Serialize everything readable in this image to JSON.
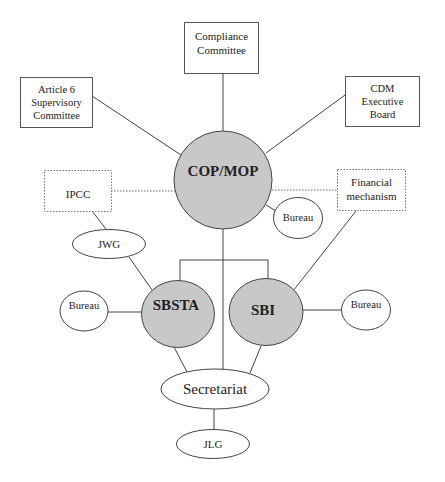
{
  "diagram": {
    "title": "",
    "nodes": {
      "compliance": {
        "line1": "Compliance",
        "line2": "Committee"
      },
      "article6": {
        "line1": "Article 6",
        "line2": "Supervisory",
        "line3": "Committee"
      },
      "cdm": {
        "line1": "CDM",
        "line2": "Executive",
        "line3": "Board"
      },
      "copmop": {
        "label": "COP/MOP"
      },
      "ipcc": {
        "label": "IPCC"
      },
      "financial": {
        "line1": "Financial",
        "line2": "mechanism"
      },
      "bureau_cop": {
        "label": "Bureau"
      },
      "jwg": {
        "label": "JWG"
      },
      "sbsta": {
        "label": "SBSTA"
      },
      "sbi": {
        "label": "SBI"
      },
      "bureau_sbsta": {
        "label": "Bureau"
      },
      "bureau_sbi": {
        "label": "Bureau"
      },
      "secretariat": {
        "label": "Secretariat"
      },
      "jlg": {
        "label": "JLG"
      }
    },
    "edges": [
      {
        "from": "compliance",
        "to": "copmop",
        "style": "solid"
      },
      {
        "from": "article6",
        "to": "copmop",
        "style": "solid"
      },
      {
        "from": "cdm",
        "to": "copmop",
        "style": "solid"
      },
      {
        "from": "ipcc",
        "to": "copmop",
        "style": "dotted"
      },
      {
        "from": "financial",
        "to": "copmop",
        "style": "dotted"
      },
      {
        "from": "copmop",
        "to": "bureau_cop",
        "style": "solid"
      },
      {
        "from": "ipcc",
        "to": "jwg",
        "style": "solid"
      },
      {
        "from": "jwg",
        "to": "sbsta",
        "style": "solid"
      },
      {
        "from": "financial",
        "to": "sbi",
        "style": "solid"
      },
      {
        "from": "copmop",
        "to": "sbsta",
        "style": "solid"
      },
      {
        "from": "copmop",
        "to": "sbi",
        "style": "solid"
      },
      {
        "from": "copmop",
        "to": "secretariat",
        "style": "solid"
      },
      {
        "from": "bureau_sbsta",
        "to": "sbsta",
        "style": "solid"
      },
      {
        "from": "sbi",
        "to": "bureau_sbi",
        "style": "solid"
      },
      {
        "from": "sbsta",
        "to": "secretariat",
        "style": "solid"
      },
      {
        "from": "sbi",
        "to": "secretariat",
        "style": "solid"
      },
      {
        "from": "secretariat",
        "to": "jlg",
        "style": "solid"
      }
    ],
    "colors": {
      "primary_fill": "#c8c8c8",
      "secondary_fill": "#ffffff",
      "stroke": "#444444"
    }
  }
}
